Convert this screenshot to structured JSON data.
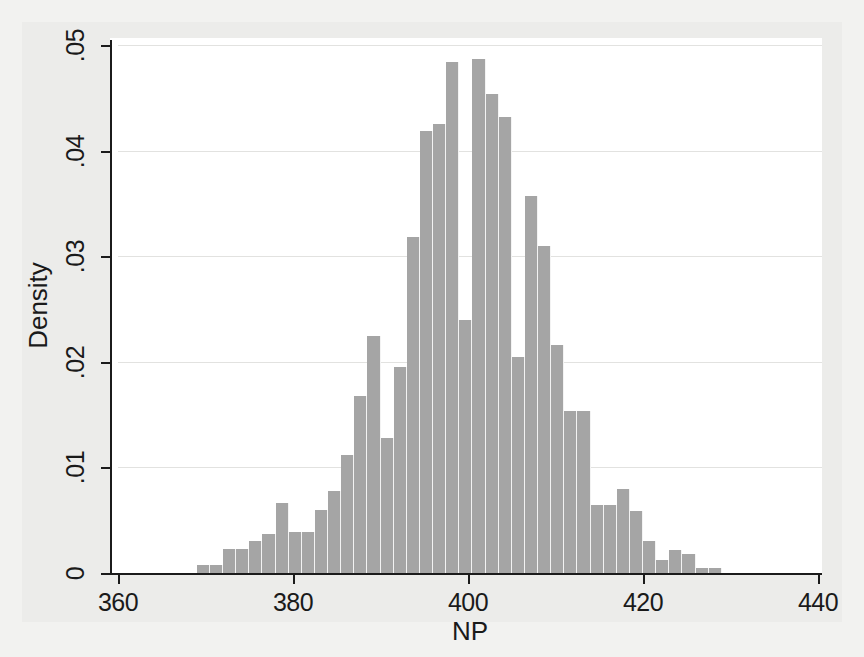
{
  "chart_data": {
    "type": "bar",
    "title": "",
    "subtitle": "",
    "xlabel": "NP",
    "ylabel": "Density",
    "xlim": [
      355,
      440
    ],
    "ylim": [
      0,
      0.05
    ],
    "grid": true,
    "legend": null,
    "bin_width": 1.5,
    "bar_color": "#a5a5a5",
    "xticks": [
      360,
      380,
      400,
      420,
      440
    ],
    "xticklabels": [
      "360",
      "380",
      "400",
      "420",
      "440"
    ],
    "yticks": [
      0,
      0.01,
      0.02,
      0.03,
      0.04,
      0.05
    ],
    "yticklabels": [
      "0",
      ".01",
      ".02",
      ".03",
      ".04",
      ".05"
    ],
    "categories": [
      "369.0",
      "370.5",
      "372.0",
      "373.5",
      "375.0",
      "376.5",
      "378.0",
      "379.5",
      "381.0",
      "382.5",
      "384.0",
      "385.5",
      "387.0",
      "388.5",
      "390.0",
      "391.5",
      "393.0",
      "394.5",
      "396.0",
      "397.5",
      "399.0",
      "400.5",
      "402.0",
      "403.5",
      "405.0",
      "406.5",
      "408.0",
      "409.5",
      "411.0",
      "412.5",
      "414.0",
      "415.5",
      "417.0",
      "418.5",
      "420.0",
      "421.5",
      "423.0",
      "424.5",
      "426.0",
      "427.5"
    ],
    "values": [
      0.0008,
      0.0008,
      0.0023,
      0.0023,
      0.003,
      0.0037,
      0.0066,
      0.0039,
      0.0039,
      0.006,
      0.0078,
      0.0112,
      0.0168,
      0.0224,
      0.0128,
      0.0195,
      0.0318,
      0.0419,
      0.0425,
      0.0484,
      0.024,
      0.0487,
      0.0454,
      0.0432,
      0.0205,
      0.0357,
      0.031,
      0.0216,
      0.0153,
      0.0153,
      0.0064,
      0.0064,
      0.008,
      0.0059,
      0.003,
      0.0012,
      0.0022,
      0.0018,
      0.0005,
      0.0005
    ]
  },
  "axes": {
    "x_title": "NP",
    "y_title": "Density"
  }
}
